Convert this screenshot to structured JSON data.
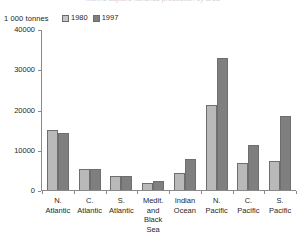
{
  "title_sliver": "Marine capture fisheries production by area",
  "axis_unit_label": "1 000 tonnes",
  "legend": {
    "position": "top-left",
    "entries": [
      {
        "label": "1980",
        "color": "#b9b9b9"
      },
      {
        "label": "1997",
        "color": "#7f7f7f"
      }
    ]
  },
  "yaxis": {
    "ticks": [
      0,
      10000,
      20000,
      30000,
      40000
    ],
    "tick_labels": [
      "0",
      "10000",
      "20000",
      "30000",
      "40000"
    ]
  },
  "chart_data": {
    "type": "bar",
    "title": "",
    "xlabel": "",
    "ylabel": "1 000 tonnes",
    "ylim": [
      0,
      40000
    ],
    "grid": false,
    "legend_position": "top-left",
    "categories": [
      "N. Atlantic",
      "C. Atlantic",
      "S. Atlantic",
      "Medit. and Black Sea",
      "Indian Ocean",
      "N. Pacific",
      "C. Pacific",
      "S. Pacific"
    ],
    "category_lines": [
      [
        "N.",
        "Atlantic"
      ],
      [
        "C.",
        "Atlantic"
      ],
      [
        "S.",
        "Atlantic"
      ],
      [
        "Medit.",
        "and",
        "Black",
        "Sea"
      ],
      [
        "Indian",
        "Ocean"
      ],
      [
        "N.",
        "Pacific"
      ],
      [
        "C.",
        "Pacific"
      ],
      [
        "S.",
        "Pacific"
      ]
    ],
    "series": [
      {
        "name": "1980",
        "color": "#b9b9b9",
        "values": [
          15000,
          5200,
          3500,
          1800,
          4200,
          21000,
          6700,
          7300
        ]
      },
      {
        "name": "1997",
        "color": "#7f7f7f",
        "values": [
          14200,
          5200,
          3600,
          2200,
          7800,
          32700,
          11300,
          18300
        ]
      }
    ]
  }
}
